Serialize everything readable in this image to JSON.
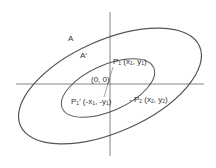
{
  "diagram": {
    "colors": {
      "stroke": "#555555",
      "text": "#333333",
      "background": "#ffffff"
    },
    "labels": {
      "outer_region": "A",
      "inner_region": "A′",
      "origin": "(0, 0)",
      "p1_name": "P",
      "p1_sub": "1",
      "p1_coords_open": " (x",
      "p1_x_sub": "1",
      "p1_mid": ", y",
      "p1_y_sub": "1",
      "p1_close": ")",
      "p1p_name": "P",
      "p1p_sub": "1",
      "p1p_prime": "′",
      "p1p_coords_open": " (-x",
      "p1p_x_sub": "1",
      "p1p_mid": ", -y",
      "p1p_y_sub": "1",
      "p1p_close": ")",
      "p2_prefix": "- ",
      "p2_name": "P",
      "p2_sub": "2",
      "p2_coords_open": " (x",
      "p2_x_sub": "2",
      "p2_mid": ", y",
      "p2_y_sub": "2",
      "p2_close": ")"
    }
  }
}
